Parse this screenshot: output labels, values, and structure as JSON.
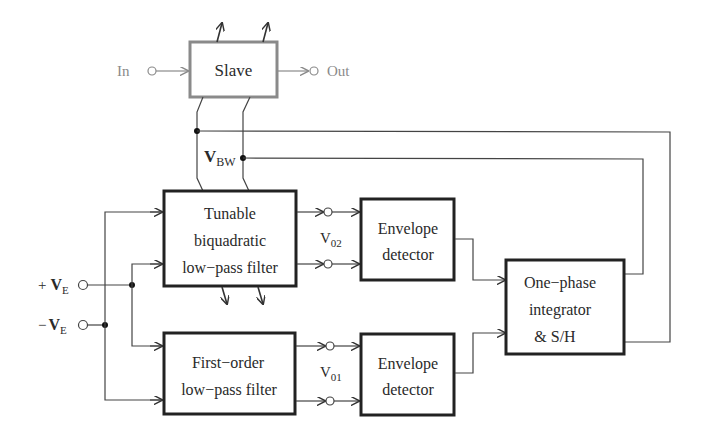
{
  "diagram": {
    "slave": {
      "label": "Slave",
      "input_label": "In",
      "output_label": "Out"
    },
    "bus_label": {
      "main": "V",
      "sub": "BW"
    },
    "inputs": {
      "plus": {
        "sign": "+",
        "main": "V",
        "sub": "E"
      },
      "minus": {
        "sign": "−",
        "main": "V",
        "sub": "E"
      }
    },
    "tunable_filter": {
      "lines": [
        "Tunable",
        "biquadratic",
        "low−pass filter"
      ]
    },
    "first_order_filter": {
      "lines": [
        "First−order",
        "low−pass filter"
      ]
    },
    "v02": {
      "main": "V",
      "sub": "02"
    },
    "v01": {
      "main": "V",
      "sub": "01"
    },
    "envelope_top": {
      "lines": [
        "Envelope",
        "detector"
      ]
    },
    "envelope_bottom": {
      "lines": [
        "Envelope",
        "detector"
      ]
    },
    "integrator": {
      "lines": [
        "One−phase",
        "integrator",
        "& S/H"
      ]
    },
    "colors": {
      "master": "#222222",
      "slave": "#8a8a8a",
      "wire": "#444444"
    }
  }
}
